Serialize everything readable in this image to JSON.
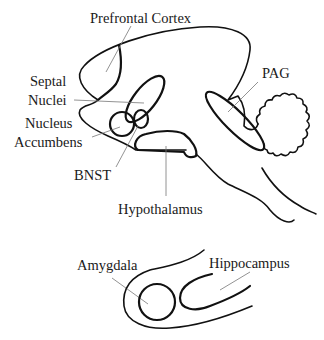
{
  "diagram": {
    "type": "brain anatomy schematic (sagittal section + temporal lobe detail)",
    "labels": {
      "prefrontal_cortex": "Prefrontal Cortex",
      "septal_line1": "Septal",
      "septal_line2": "Nuclei",
      "nucleus_line1": "Nucleus",
      "nucleus_line2": "Accumbens",
      "bnst": "BNST",
      "hypothalamus": "Hypothalamus",
      "pag": "PAG",
      "amygdala": "Amygdala",
      "hippocampus": "Hippocampus"
    },
    "colors": {
      "outline": "#111111",
      "leader": "#777777",
      "text": "#1a1a1a",
      "background": "#ffffff"
    }
  }
}
